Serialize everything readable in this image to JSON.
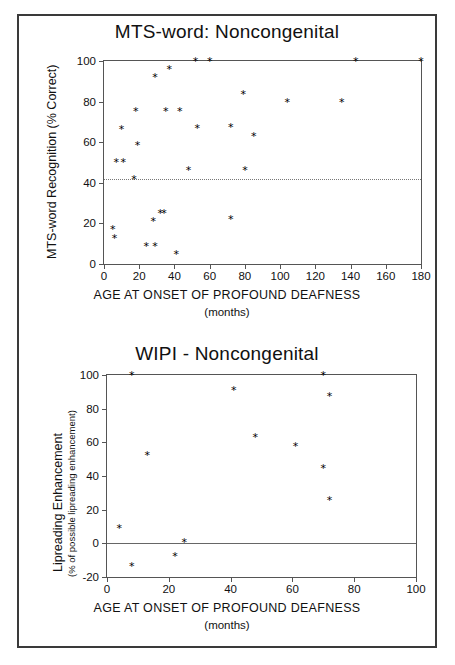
{
  "figure": {
    "panel_count": 2
  },
  "chart_data": [
    {
      "type": "scatter",
      "title": "MTS-word: Noncongenital",
      "xlabel": "AGE AT ONSET OF PROFOUND DEAFNESS",
      "xunit": "(months)",
      "ylabel": "MTS-word Recognition (% Correct)",
      "xlim": [
        0,
        180
      ],
      "ylim": [
        0,
        100
      ],
      "xticks": [
        0,
        20,
        40,
        60,
        80,
        100,
        120,
        140,
        160,
        180
      ],
      "yticks": [
        0,
        20,
        40,
        60,
        80,
        100
      ],
      "grid": false,
      "legend": "none",
      "marker": "asterisk",
      "reference_line": {
        "y": 42,
        "style": "dotted",
        "label": ""
      },
      "points": [
        {
          "x": 5,
          "y": 17
        },
        {
          "x": 6,
          "y": 12.5
        },
        {
          "x": 7,
          "y": 50
        },
        {
          "x": 10,
          "y": 66.5
        },
        {
          "x": 11,
          "y": 50
        },
        {
          "x": 17,
          "y": 41.5
        },
        {
          "x": 18,
          "y": 75
        },
        {
          "x": 19,
          "y": 58.5
        },
        {
          "x": 24,
          "y": 8.5
        },
        {
          "x": 28,
          "y": 20.8
        },
        {
          "x": 29,
          "y": 8.5
        },
        {
          "x": 29,
          "y": 92
        },
        {
          "x": 32,
          "y": 25
        },
        {
          "x": 34,
          "y": 25
        },
        {
          "x": 35,
          "y": 75
        },
        {
          "x": 37,
          "y": 96
        },
        {
          "x": 41,
          "y": 4.5
        },
        {
          "x": 43,
          "y": 75
        },
        {
          "x": 48,
          "y": 46
        },
        {
          "x": 52,
          "y": 100
        },
        {
          "x": 53,
          "y": 66.8
        },
        {
          "x": 60,
          "y": 100
        },
        {
          "x": 72,
          "y": 21.8
        },
        {
          "x": 72,
          "y": 67
        },
        {
          "x": 79,
          "y": 83.3
        },
        {
          "x": 80,
          "y": 46
        },
        {
          "x": 85,
          "y": 62.7
        },
        {
          "x": 104,
          "y": 79.5
        },
        {
          "x": 135,
          "y": 79.7
        },
        {
          "x": 143,
          "y": 100
        },
        {
          "x": 180,
          "y": 100
        }
      ]
    },
    {
      "type": "scatter",
      "title": "WIPI - Noncongenital",
      "xlabel": "AGE AT ONSET OF PROFOUND DEAFNESS",
      "xunit": "(months)",
      "ylabel": "Lipreading Enhancement",
      "ylabel_sub": "(% of possible lipreading enhancement)",
      "xlim": [
        0,
        100
      ],
      "ylim": [
        -20,
        100
      ],
      "xticks": [
        0,
        20,
        40,
        60,
        80,
        100
      ],
      "yticks": [
        -20,
        0,
        20,
        40,
        60,
        80,
        100
      ],
      "ytick_labels": [
        "-20",
        "0",
        "20",
        "40",
        "60",
        "80",
        "100"
      ],
      "grid": false,
      "legend": "none",
      "marker": "asterisk",
      "reference_line": {
        "y": 0,
        "style": "solid",
        "label": ""
      },
      "points": [
        {
          "x": 4,
          "y": 9
        },
        {
          "x": 8,
          "y": 100
        },
        {
          "x": 8,
          "y": -14
        },
        {
          "x": 13,
          "y": 52
        },
        {
          "x": 22,
          "y": -8
        },
        {
          "x": 25,
          "y": 0.5
        },
        {
          "x": 41,
          "y": 91
        },
        {
          "x": 48,
          "y": 63
        },
        {
          "x": 61,
          "y": 57.5
        },
        {
          "x": 70,
          "y": 100
        },
        {
          "x": 70,
          "y": 44.5
        },
        {
          "x": 72,
          "y": 87
        },
        {
          "x": 72,
          "y": 25.5
        }
      ]
    }
  ]
}
